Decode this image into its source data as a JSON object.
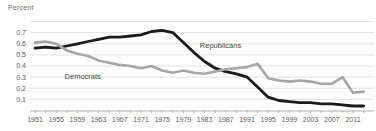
{
  "chart_data": {
    "type": "line",
    "title": "",
    "ylabel": "Percent",
    "xlabel": "",
    "grid": true,
    "legend_position": "inline-annotations",
    "ylim": [
      0,
      0.8
    ],
    "yticks_labeled": [
      0.1,
      0.2,
      0.3,
      0.4,
      0.5,
      0.6,
      0.7
    ],
    "gridline_values": [
      0.1,
      0.2,
      0.3,
      0.4,
      0.5,
      0.6,
      0.7,
      0.8
    ],
    "xticks_labeled": [
      1951,
      1955,
      1959,
      1963,
      1967,
      1971,
      1975,
      1979,
      1983,
      1987,
      1991,
      1995,
      1999,
      2003,
      2007,
      2011
    ],
    "x": [
      1951,
      1953,
      1955,
      1957,
      1959,
      1961,
      1963,
      1965,
      1967,
      1969,
      1971,
      1973,
      1975,
      1977,
      1979,
      1981,
      1983,
      1985,
      1987,
      1989,
      1991,
      1993,
      1995,
      1997,
      1999,
      2001,
      2003,
      2005,
      2007,
      2009,
      2011,
      2013
    ],
    "series": [
      {
        "name": "Republicans",
        "color": "#1b1b1b",
        "stroke_width": 2.8,
        "values": [
          0.56,
          0.57,
          0.56,
          0.58,
          0.6,
          0.62,
          0.64,
          0.66,
          0.66,
          0.67,
          0.68,
          0.71,
          0.72,
          0.7,
          0.61,
          0.52,
          0.44,
          0.38,
          0.35,
          0.33,
          0.3,
          0.21,
          0.12,
          0.09,
          0.08,
          0.07,
          0.07,
          0.06,
          0.06,
          0.05,
          0.04,
          0.04
        ]
      },
      {
        "name": "Democrats",
        "color": "#a6a6a6",
        "stroke_width": 2.6,
        "values": [
          0.61,
          0.62,
          0.6,
          0.54,
          0.51,
          0.49,
          0.45,
          0.43,
          0.41,
          0.4,
          0.38,
          0.4,
          0.36,
          0.34,
          0.36,
          0.34,
          0.33,
          0.35,
          0.37,
          0.38,
          0.39,
          0.42,
          0.29,
          0.27,
          0.26,
          0.27,
          0.26,
          0.24,
          0.24,
          0.3,
          0.16,
          0.17
        ]
      }
    ],
    "annotations": [
      {
        "text": "Republicans",
        "x": 1986,
        "y": 0.58,
        "series": "Republicans"
      },
      {
        "text": "Democrats",
        "x": 1960,
        "y": 0.31,
        "series": "Democrats"
      }
    ],
    "colors": {
      "gridline": "#d9d9d9",
      "axis": "#9a9a9a",
      "tick_text": "#5a5a5a",
      "unit_text": "#6e6e6e"
    }
  }
}
